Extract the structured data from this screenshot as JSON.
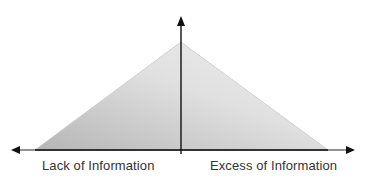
{
  "diagram": {
    "type": "triangle-curve",
    "labels": {
      "left": "Lack of Information",
      "right": "Excess of Information"
    },
    "colors": {
      "axis": "#1a1a1a",
      "baseline": "#3a3a3a",
      "fill_dark": "#b5b5b5",
      "fill_light": "#ececec",
      "text": "#333333"
    }
  }
}
